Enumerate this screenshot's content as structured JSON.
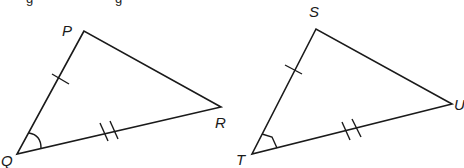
{
  "diagram": {
    "top_text_fragment": "g            g",
    "triangles": [
      {
        "name": "PQR",
        "vertices": {
          "P": {
            "label": "P",
            "x": 84,
            "y": 31
          },
          "Q": {
            "label": "Q",
            "x": 17,
            "y": 154
          },
          "R": {
            "label": "R",
            "x": 221,
            "y": 107
          }
        },
        "marks": {
          "PQ": "single tick",
          "QR": "double tick",
          "angle_Q": "arc"
        }
      },
      {
        "name": "STU",
        "vertices": {
          "S": {
            "label": "S",
            "x": 316,
            "y": 29
          },
          "T": {
            "label": "T",
            "x": 252,
            "y": 154
          },
          "U": {
            "label": "U",
            "x": 452,
            "y": 104
          }
        },
        "marks": {
          "ST": "single tick",
          "TU": "double tick",
          "angle_T": "arc"
        }
      }
    ],
    "colors": {
      "stroke": "#1a1a1a",
      "background": "#ffffff"
    }
  }
}
